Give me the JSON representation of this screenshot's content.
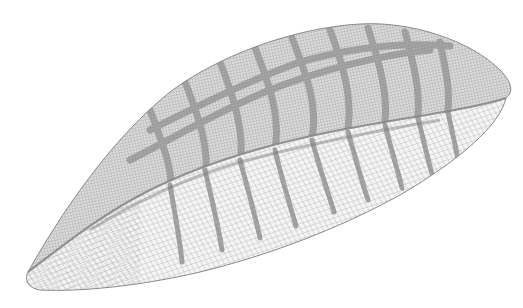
{
  "figure": {
    "background_color": "#ffffff",
    "mesh_color": "#8a8a8a",
    "dense_mesh_color": "#9a9a9a",
    "rib_color": "#6e6e6e"
  }
}
